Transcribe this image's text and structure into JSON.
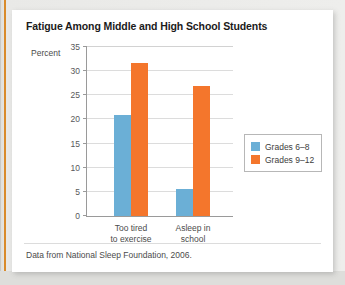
{
  "figure": {
    "title": "Fatigue Among Middle and High School Students",
    "footnote": "Data from National Sleep Foundation, 2006.",
    "accent_color": "#d98b2b",
    "card_background": "#ffffff",
    "page_background": "#e8e8e6"
  },
  "chart_data": {
    "type": "bar",
    "title": "Fatigue Among Middle and High School Students",
    "subtitle": "",
    "xlabel": "",
    "ylabel": "Percent",
    "ylim": [
      0,
      35
    ],
    "yticks": [
      0,
      5,
      10,
      15,
      20,
      25,
      30,
      35
    ],
    "ytick_labels": [
      "0",
      "5",
      "10",
      "15",
      "20",
      "25",
      "30",
      "35"
    ],
    "grid": true,
    "grid_axis": "y",
    "legend_position": "right",
    "categories": [
      "Too tired to exercise",
      "Asleep in school"
    ],
    "category_lines": [
      [
        "Too tired",
        "to exercise"
      ],
      [
        "Asleep in",
        "school"
      ]
    ],
    "series": [
      {
        "name": "Grades 6–8",
        "color": "#6bafd6",
        "values": [
          21,
          5.5
        ]
      },
      {
        "name": "Grades 9–12",
        "color": "#f4762c",
        "values": [
          31.7,
          27
        ]
      }
    ],
    "annotations": [],
    "source_note": "Data from National Sleep Foundation, 2006."
  },
  "legend": {
    "items": [
      {
        "label": "Grades 6–8",
        "color": "#6bafd6"
      },
      {
        "label": "Grades 9–12",
        "color": "#f4762c"
      }
    ]
  }
}
